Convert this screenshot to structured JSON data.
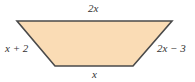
{
  "figure": {
    "shape": "trapezoid",
    "fill_color": "#FADCB5",
    "stroke_color": "#4A4A4A",
    "vertices": {
      "top_left": [
        17,
        21
      ],
      "top_right": [
        172,
        21
      ],
      "bottom_right": [
        133,
        66
      ],
      "bottom_left": [
        55,
        66
      ]
    },
    "labels": {
      "top": "2x",
      "left": "x + 2",
      "right": "2x − 3",
      "bottom": "x"
    }
  }
}
